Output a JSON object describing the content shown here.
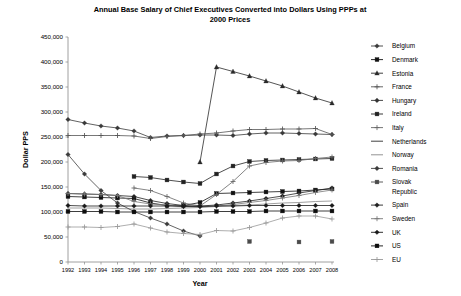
{
  "chart_data": {
    "type": "line",
    "title": "Annual Base Salary of Chief Executives Converted into Dollars Using PPPs at 2000 Prices",
    "title_line1": "Annual Base Salary of Chief Executives Converted into Dollars Using PPPs at",
    "title_line2": "2000 Prices",
    "xlabel": "Year",
    "ylabel": "Dollar PPS",
    "xlim": [
      1992,
      2008
    ],
    "ylim": [
      0,
      450000
    ],
    "ytick_step": 50000,
    "grid": false,
    "legend_position": "right",
    "categories": [
      1992,
      1993,
      1994,
      1995,
      1996,
      1997,
      1998,
      1999,
      2000,
      2001,
      2002,
      2003,
      2004,
      2005,
      2006,
      2007,
      2008
    ],
    "ytick_labels": [
      "0",
      "50,000",
      "100,000",
      "150,000",
      "200,000",
      "250,000",
      "300,000",
      "350,000",
      "400,000",
      "450,000"
    ],
    "xtick_labels": [
      "1992",
      "1993",
      "1994",
      "1995",
      "1996",
      "1997",
      "1998",
      "1999",
      "2000",
      "2001",
      "2002",
      "2003",
      "2004",
      "2005",
      "2006",
      "2007",
      "2008"
    ],
    "series": [
      {
        "name": "Belgium",
        "marker": "diamond",
        "color": "#3a3a3a",
        "values": [
          285000,
          278000,
          272000,
          268000,
          262000,
          249000,
          252000,
          253000,
          254000,
          254000,
          253000,
          256000,
          258000,
          258000,
          257000,
          256000,
          255000
        ]
      },
      {
        "name": "Denmark",
        "marker": "square",
        "color": "#111111",
        "values": [
          131000,
          130000,
          129000,
          128000,
          127000,
          118000,
          113000,
          113000,
          119000,
          137000,
          138000,
          139000,
          140000,
          141000,
          142000,
          144000,
          146000
        ]
      },
      {
        "name": "Estonia",
        "marker": "triangle",
        "color": "#2a2a2a",
        "values": [
          null,
          null,
          null,
          null,
          null,
          null,
          null,
          null,
          200000,
          390000,
          381000,
          372000,
          362000,
          352000,
          340000,
          328000,
          318000
        ]
      },
      {
        "name": "France",
        "marker": "plus",
        "color": "#555555",
        "values": [
          253000,
          253000,
          253000,
          253000,
          252000,
          247000,
          251000,
          253000,
          256000,
          258000,
          262000,
          265000,
          265000,
          266000,
          266000,
          267000,
          255000
        ]
      },
      {
        "name": "Hungary",
        "marker": "diamond",
        "color": "#333333",
        "values": [
          null,
          null,
          null,
          null,
          null,
          null,
          null,
          null,
          null,
          null,
          null,
          null,
          null,
          null,
          null,
          null,
          null
        ]
      },
      {
        "name": "Ireland",
        "marker": "square",
        "color": "#222222",
        "values": [
          null,
          null,
          null,
          null,
          171000,
          169000,
          164000,
          160000,
          157000,
          176000,
          192000,
          201000,
          203000,
          204000,
          205000,
          206000,
          207000
        ]
      },
      {
        "name": "Italy",
        "marker": "plus",
        "color": "#666666",
        "values": [
          null,
          null,
          null,
          null,
          148000,
          143000,
          131000,
          118000,
          112000,
          135000,
          161000,
          192000,
          199000,
          202000,
          203000,
          207000,
          210000
        ]
      },
      {
        "name": "Netherlands",
        "marker": "none",
        "color": "#2b2b2b",
        "values": [
          null,
          null,
          null,
          null,
          null,
          null,
          null,
          null,
          null,
          null,
          null,
          null,
          null,
          null,
          null,
          null,
          null
        ]
      },
      {
        "name": "Norway",
        "marker": "none",
        "color": "#888888",
        "values": [
          108000,
          108000,
          108000,
          107000,
          106000,
          106000,
          107000,
          108000,
          109000,
          111000,
          113000,
          114000,
          116000,
          118000,
          119000,
          121000,
          122000
        ]
      },
      {
        "name": "Romania",
        "marker": "diamond",
        "color": "#3c3c3c",
        "values": [
          215000,
          176000,
          143000,
          118000,
          101000,
          88000,
          76000,
          62000,
          52000,
          null,
          null,
          null,
          null,
          null,
          null,
          null,
          null
        ]
      },
      {
        "name": "Slovak Republic",
        "marker": "square",
        "color": "#4a4a4a",
        "values": [
          null,
          null,
          null,
          null,
          null,
          null,
          null,
          null,
          null,
          null,
          null,
          41000,
          null,
          null,
          40000,
          null,
          41000
        ]
      },
      {
        "name": "Spain",
        "marker": "diamond",
        "color": "#222222",
        "values": [
          137000,
          136000,
          135000,
          133000,
          131000,
          123000,
          117000,
          113000,
          112000,
          114000,
          118000,
          122000,
          127000,
          132000,
          138000,
          143000,
          148000
        ]
      },
      {
        "name": "Sweden",
        "marker": "plus",
        "color": "#777777",
        "values": [
          137000,
          136000,
          135000,
          133000,
          121000,
          116000,
          114000,
          111000,
          110000,
          112000,
          115000,
          119000,
          123000,
          128000,
          133000,
          139000,
          144000
        ]
      },
      {
        "name": "UK",
        "marker": "diamond",
        "color": "#1a1a1a",
        "values": [
          113000,
          112000,
          112000,
          112000,
          112000,
          112000,
          112000,
          111000,
          111000,
          112000,
          112000,
          113000,
          113000,
          113000,
          113000,
          113000,
          113000
        ]
      },
      {
        "name": "US",
        "marker": "square",
        "color": "#0d0d0d",
        "values": [
          101000,
          101000,
          101000,
          100000,
          100000,
          100000,
          100000,
          100000,
          100000,
          101000,
          101000,
          101000,
          102000,
          102000,
          102000,
          102000,
          102000
        ]
      },
      {
        "name": "EU",
        "marker": "plus",
        "color": "#999999",
        "values": [
          70000,
          70000,
          69000,
          71000,
          76000,
          68000,
          60000,
          57000,
          55000,
          63000,
          62000,
          69000,
          78000,
          88000,
          92000,
          92000,
          86000
        ]
      }
    ]
  }
}
